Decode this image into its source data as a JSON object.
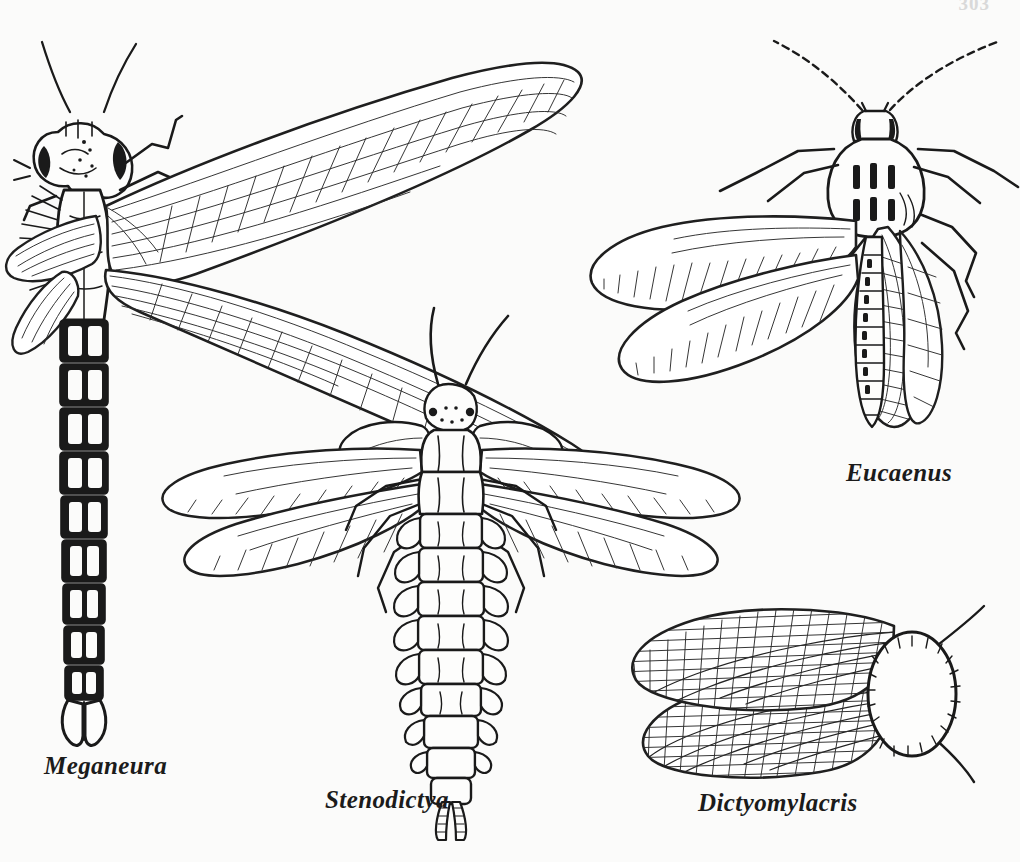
{
  "plate": {
    "background_color": "#fbfbfa",
    "ink_color": "#1a1a1a",
    "page_number": "303",
    "width": 1020,
    "height": 862
  },
  "figures": [
    {
      "id": "meganeura",
      "label": "Meganeura",
      "common_group": "giant dragonfly (Protodonata)",
      "orientation": "dorsal view, head at top",
      "position": "upper-left",
      "features": {
        "wings": 4,
        "wing_style": "long narrow wings with dense parallel longitudinal veins and cross veins",
        "abdomen_segments": 10,
        "abdomen_style": "dark heavily inked segments with pale median stripe",
        "head": "large compound eyes, short bristly antennae",
        "legs": 2,
        "terminal_appendages": "paired claspers"
      }
    },
    {
      "id": "stenodictya",
      "label": "Stenodictya",
      "common_group": "palaeodictyopteran",
      "orientation": "dorsal view, head at top",
      "position": "center",
      "features": {
        "wings": 4,
        "wing_style": "broad wings with sparse oblique veins",
        "prothoracic_winglets": 2,
        "abdomen_segments": 9,
        "abdomen_style": "pale segments with lateral lobed flanges",
        "head": "small head with two long antennae and a beak",
        "legs": 6,
        "terminal_appendages": "two long cerci"
      }
    },
    {
      "id": "eucaenus",
      "label": "Eucaenus",
      "common_group": "protorthopteran",
      "orientation": "dorsal view, head at top",
      "position": "upper-right",
      "features": {
        "wings": 4,
        "wing_style": "oval wings with fine dense diagonal venation",
        "antennae": "two very long dotted antennae",
        "pronotum": "shield-shaped with dark paired markings",
        "abdomen_segments": 10,
        "abdomen_style": "slender ladder-like segmented abdomen",
        "legs": 6
      }
    },
    {
      "id": "dictyomylacris",
      "label": "Dictyomylacris",
      "common_group": "fossil roachoid (Blattoidea)",
      "orientation": "dorsal view, head at right",
      "position": "lower-right",
      "features": {
        "wings": 2,
        "wing_style": "overlapping tegmina with dense reticulate cross-venation",
        "pronotum": "large oval shield with fringed margin",
        "antennae": 2
      }
    }
  ],
  "captions": {
    "meganeura": "Meganeura",
    "stenodictya": "Stenodictya",
    "dictyomylacris": "Dictyomylacris",
    "eucaenus": "Eucaenus"
  }
}
